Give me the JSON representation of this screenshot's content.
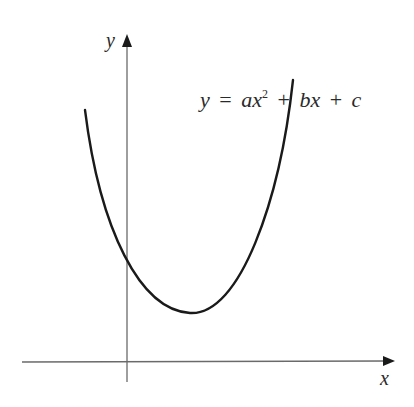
{
  "figure": {
    "type": "parabola-sketch",
    "equation": {
      "lhs": "y",
      "eq": "=",
      "a": "a",
      "x1": "x",
      "exp": "2",
      "plus1": "+",
      "b": "b",
      "x2": "x",
      "plus2": "+",
      "c": "c",
      "full": "y = ax² + bx + c"
    },
    "axes": {
      "x_label": "x",
      "y_label": "y"
    },
    "colors": {
      "curve": "#1a1a1a",
      "axis": "#555555",
      "text": "#2a2a2a",
      "background": "#ffffff"
    }
  }
}
